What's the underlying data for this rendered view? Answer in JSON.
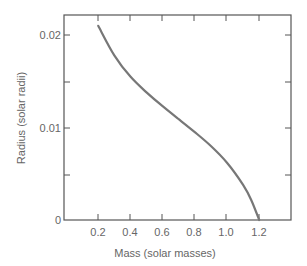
{
  "chart_data": {
    "type": "line",
    "title": "",
    "xlabel": "Mass (solar masses)",
    "ylabel": "Radius (solar radii)",
    "xlim": [
      0,
      1.4
    ],
    "ylim": [
      0,
      0.022
    ],
    "grid": false,
    "legend": null,
    "x_ticks": [
      0.2,
      0.4,
      0.6,
      0.8,
      1.0,
      1.2
    ],
    "x_tick_labels": [
      "0.2",
      "0.4",
      "0.6",
      "0.8",
      "1.0",
      "1.2"
    ],
    "y_ticks": [
      0,
      0.005,
      0.01,
      0.015,
      0.02
    ],
    "y_tick_labels": [
      "0",
      "",
      "0.01",
      "",
      "0.02"
    ],
    "series": [
      {
        "name": "White dwarf mass-radius relation",
        "color": "#777777",
        "x": [
          0.2,
          0.3,
          0.4,
          0.5,
          0.6,
          0.7,
          0.8,
          0.9,
          1.0,
          1.1,
          1.15,
          1.2
        ],
        "y": [
          0.021,
          0.0178,
          0.0155,
          0.0138,
          0.0123,
          0.0109,
          0.0095,
          0.008,
          0.0062,
          0.0038,
          0.0022,
          0.0
        ]
      }
    ]
  },
  "labels": {
    "xlabel": "Mass (solar masses)",
    "ylabel": "Radius (solar radii)",
    "x_ticks": [
      "0.2",
      "0.4",
      "0.6",
      "0.8",
      "1.0",
      "1.2"
    ],
    "y_ticks": [
      "0",
      "0.01",
      "0.02"
    ]
  }
}
